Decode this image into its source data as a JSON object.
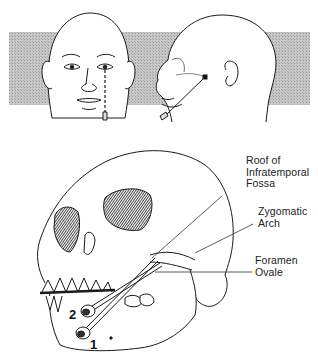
{
  "figure": {
    "panels": [
      {
        "id": "frontal-view",
        "description": "Frontal view of head with dashed vertical line from below pupil to needle at chin"
      },
      {
        "id": "lateral-view",
        "description": "Lateral view of head showing needle path toward mandibular notch marker"
      },
      {
        "id": "skull-view",
        "description": "Oblique view of skull with two needle approaches"
      }
    ],
    "labels": {
      "roof_line1": "Roof of",
      "roof_line2": "Infratemporal",
      "roof_line3": "Fossa",
      "zygomatic_line1": "Zygomatic",
      "zygomatic_line2": "Arch",
      "foramen_line1": "Foramen",
      "foramen_line2": "Ovale"
    },
    "needle_numbers": {
      "needle_1": "1",
      "needle_2": "2"
    },
    "colors": {
      "band": "#bdbdbd",
      "line": "#1a1a1a",
      "background": "#ffffff"
    }
  }
}
